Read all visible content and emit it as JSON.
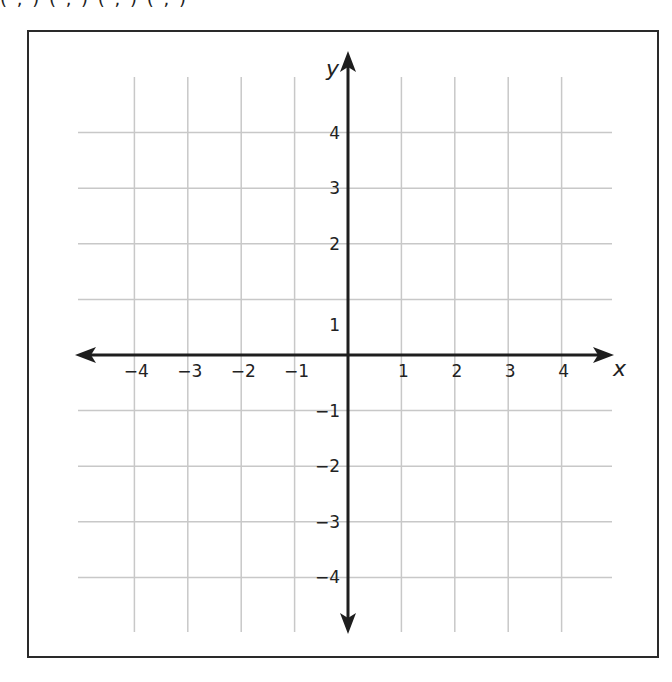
{
  "page": {
    "top_cut_text": "( , )     ( , )     ( , )     ( , )"
  },
  "chart_data": {
    "type": "scatter",
    "title": "",
    "xlabel": "x",
    "ylabel": "y",
    "xlim": [
      -5,
      5
    ],
    "ylim": [
      -5,
      5
    ],
    "grid": true,
    "x_ticks": [
      -4,
      -3,
      -2,
      -1,
      1,
      2,
      3,
      4
    ],
    "y_ticks": [
      4,
      3,
      2,
      1,
      -1,
      -2,
      -3,
      -4
    ],
    "x_tick_labels": [
      "−4",
      "−3",
      "−2",
      "−1",
      "1",
      "2",
      "3",
      "4"
    ],
    "y_tick_labels": [
      "4",
      "3",
      "2",
      "1",
      "−1",
      "−2",
      "−3",
      "−4"
    ],
    "series": [],
    "annotations": []
  },
  "colors": {
    "axis": "#1e1e1e",
    "grid": "#c8c8c8",
    "frame": "#2a2a2a",
    "text": "#222222"
  }
}
